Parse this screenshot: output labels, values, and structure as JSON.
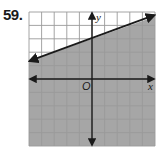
{
  "problem": {
    "number": "59."
  },
  "chart_data": {
    "type": "line",
    "title": "",
    "xlabel": "x",
    "ylabel": "y",
    "origin_label": "O",
    "xlim": [
      -5,
      5
    ],
    "ylim": [
      -5,
      5
    ],
    "grid": true,
    "grid_step": 1,
    "tick_labels_shown": false,
    "boundary_line": {
      "equation": "y = (1/3)x + 3",
      "slope": 0.3333,
      "y_intercept": 3,
      "style": "solid",
      "arrows": "both",
      "points": [
        [
          -5,
          1.33
        ],
        [
          0,
          3
        ],
        [
          3,
          4
        ],
        [
          5,
          4.67
        ]
      ]
    },
    "inequality": "y <= (1/3)x + 3",
    "shaded_region": "below",
    "colors": {
      "shade": "#a6a6a6",
      "grid_unshaded": "#9a9a9a",
      "grid_shaded": "#6e6e6e",
      "axis": "#1a1a1a",
      "line": "#1a1a1a"
    }
  }
}
